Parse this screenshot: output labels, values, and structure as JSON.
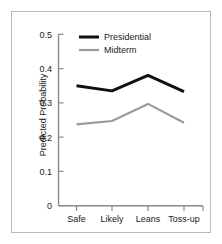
{
  "chart_data": {
    "type": "line",
    "title": "",
    "xlabel": "",
    "ylabel": "Predicted Probability",
    "categories": [
      "Safe",
      "Likely",
      "Leans",
      "Toss-up"
    ],
    "ylim": [
      0,
      0.5
    ],
    "yticks": [
      "0",
      "0.1",
      "0.2",
      "0.3",
      "0.4",
      "0.5"
    ],
    "ytick_values": [
      0,
      0.1,
      0.2,
      0.3,
      0.4,
      0.5
    ],
    "grid": false,
    "legend_position": "top-right-inside",
    "series": [
      {
        "name": "Presidential",
        "color": "#111111",
        "width": 3,
        "values": [
          0.35,
          0.335,
          0.38,
          0.333
        ]
      },
      {
        "name": "Midterm",
        "color": "#9a9a9a",
        "width": 2.2,
        "values": [
          0.237,
          0.247,
          0.297,
          0.242
        ]
      }
    ]
  },
  "figure": {
    "frame_color": "#b9b9b9",
    "axis_color": "#8a8a8a",
    "background": "#ffffff"
  }
}
